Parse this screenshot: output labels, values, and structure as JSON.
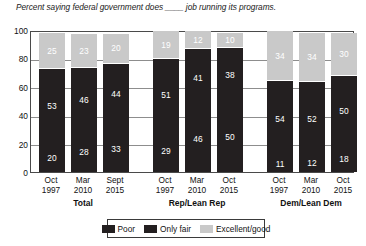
{
  "chart_data": {
    "type": "bar",
    "subtype": "stacked-100",
    "title": "Percent saying federal government does ____ job running its programs.",
    "xlabel": "",
    "ylabel": "",
    "ylim": [
      0,
      100
    ],
    "yticks": [
      0,
      20,
      40,
      60,
      80,
      100
    ],
    "grid": true,
    "legend_position": "bottom",
    "categories": [
      "Oct 1997",
      "Mar 2010",
      "Sept 2015",
      "Oct 1997",
      "Mar 2010",
      "Oct 2015",
      "Oct 1997",
      "Mar 2010",
      "Oct 2015"
    ],
    "series": [
      {
        "name": "Poor",
        "color": "#231f20",
        "values": [
          20,
          28,
          33,
          29,
          46,
          50,
          11,
          12,
          18
        ]
      },
      {
        "name": "Only fair",
        "color": "#231f20",
        "values": [
          53,
          46,
          44,
          51,
          41,
          38,
          54,
          52,
          50
        ]
      },
      {
        "name": "Excellent/good",
        "color": "#c9c9c9",
        "values": [
          25,
          23,
          20,
          19,
          12,
          10,
          34,
          34,
          30
        ]
      }
    ],
    "groups": [
      {
        "label": "Total",
        "bars": [
          {
            "line1": "Oct",
            "line2": "1997",
            "poor": 20,
            "only_fair": 53,
            "excellent_good": 25
          },
          {
            "line1": "Mar",
            "line2": "2010",
            "poor": 28,
            "only_fair": 46,
            "excellent_good": 23
          },
          {
            "line1": "Sept",
            "line2": "2015",
            "poor": 33,
            "only_fair": 44,
            "excellent_good": 20
          }
        ]
      },
      {
        "label": "Rep/Lean Rep",
        "bars": [
          {
            "line1": "Oct",
            "line2": "1997",
            "poor": 29,
            "only_fair": 51,
            "excellent_good": 19
          },
          {
            "line1": "Mar",
            "line2": "2010",
            "poor": 46,
            "only_fair": 41,
            "excellent_good": 12
          },
          {
            "line1": "Oct",
            "line2": "2015",
            "poor": 50,
            "only_fair": 38,
            "excellent_good": 10
          }
        ]
      },
      {
        "label": "Dem/Lean Dem",
        "bars": [
          {
            "line1": "Oct",
            "line2": "1997",
            "poor": 11,
            "only_fair": 54,
            "excellent_good": 34
          },
          {
            "line1": "Mar",
            "line2": "2010",
            "poor": 12,
            "only_fair": 52,
            "excellent_good": 34
          },
          {
            "line1": "Oct",
            "line2": "2015",
            "poor": 18,
            "only_fair": 50,
            "excellent_good": 30
          }
        ]
      }
    ],
    "legend": [
      {
        "label": "Poor",
        "color": "#231f20"
      },
      {
        "label": "Only fair",
        "color": "#231f20"
      },
      {
        "label": "Excellent/good",
        "color": "#c9c9c9"
      }
    ]
  },
  "axis": {
    "y_labels": [
      "100",
      "80",
      "60",
      "40",
      "20",
      "0"
    ]
  }
}
